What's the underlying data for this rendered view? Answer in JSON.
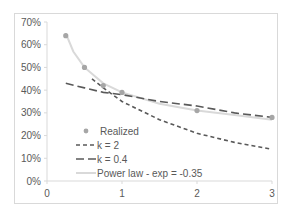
{
  "chart_data": {
    "type": "line",
    "title": "",
    "xlabel": "",
    "ylabel": "",
    "xlim": [
      0,
      3
    ],
    "ylim": [
      0,
      0.7
    ],
    "x_ticks": [
      "0",
      "1",
      "2",
      "3"
    ],
    "y_ticks": [
      "0%",
      "10%",
      "20%",
      "30%",
      "40%",
      "50%",
      "60%",
      "70%"
    ],
    "grid": false,
    "legend_position": "inside-bottom-left",
    "series": [
      {
        "name": "Realized",
        "style": "markers",
        "color": "#a6a6a6",
        "x": [
          0.25,
          0.5,
          0.75,
          1.0,
          2.0,
          3.0
        ],
        "values": [
          0.64,
          0.5,
          0.42,
          0.39,
          0.31,
          0.28
        ]
      },
      {
        "name": "k = 2",
        "style": "short-dash",
        "color": "#595959",
        "x": [
          0.6,
          0.75,
          1.0,
          1.5,
          2.0,
          2.5,
          3.0
        ],
        "values": [
          0.45,
          0.41,
          0.35,
          0.27,
          0.21,
          0.17,
          0.14
        ]
      },
      {
        "name": "k = 0.4",
        "style": "long-dash",
        "color": "#595959",
        "x": [
          0.25,
          0.5,
          0.75,
          1.0,
          1.5,
          2.0,
          2.5,
          3.0
        ],
        "values": [
          0.43,
          0.41,
          0.39,
          0.38,
          0.35,
          0.33,
          0.3,
          0.28
        ]
      },
      {
        "name": "Power law - exp = -0.35",
        "style": "solid",
        "color": "#d9d9d9",
        "x": [
          0.25,
          0.35,
          0.5,
          0.75,
          1.0,
          1.5,
          2.0,
          2.5,
          3.0
        ],
        "values": [
          0.65,
          0.57,
          0.5,
          0.43,
          0.39,
          0.34,
          0.31,
          0.29,
          0.27
        ]
      }
    ]
  }
}
